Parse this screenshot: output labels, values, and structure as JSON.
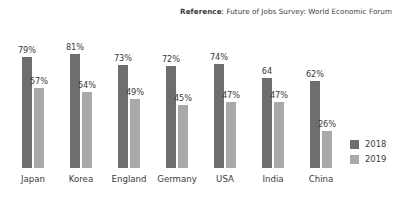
{
  "reference": {
    "label": "Reference",
    "separator": ": ",
    "text": "Future of Jobs Survey:  World Economic Forum"
  },
  "legend": {
    "position": "bottom-right",
    "entries": [
      {
        "name": "2018",
        "color": "#6e6e6e"
      },
      {
        "name": "2019",
        "color": "#a9a9a9"
      }
    ]
  },
  "chart_data": {
    "type": "bar",
    "title": "",
    "subtitle": "",
    "xlabel": "",
    "ylabel": "",
    "ylim": [
      0,
      100
    ],
    "grid": false,
    "legend_position": "bottom-right",
    "categories": [
      "Japan",
      "Korea",
      "England",
      "Germany",
      "USA",
      "India",
      "China"
    ],
    "series": [
      {
        "name": "2018",
        "color": "#6e6e6e",
        "values": [
          79,
          81,
          73,
          72,
          74,
          64,
          62
        ],
        "labels": [
          "79%",
          "81%",
          "73%",
          "72%",
          "74%",
          "64",
          "62%"
        ]
      },
      {
        "name": "2019",
        "color": "#a9a9a9",
        "values": [
          57,
          54,
          49,
          45,
          47,
          47,
          26
        ],
        "labels": [
          "57%",
          "54%",
          "49%",
          "45%",
          "47%",
          "47%",
          "26%"
        ]
      }
    ],
    "annotations": [
      "Reference: Future of Jobs Survey:  World Economic Forum"
    ]
  }
}
